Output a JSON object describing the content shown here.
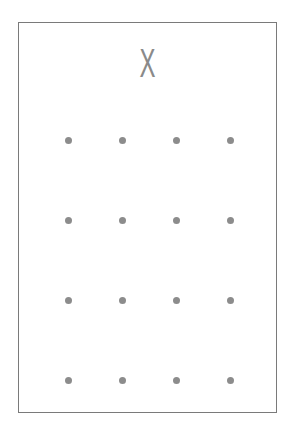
{
  "card": {
    "symbol": "X",
    "symbol_color": "#8a8a8a",
    "border_color": "#7a7a7a",
    "dot_color": "#8c8c8c",
    "grid": {
      "rows": 4,
      "cols": 4,
      "dots": [
        {
          "row": 1,
          "col": 1
        },
        {
          "row": 1,
          "col": 2
        },
        {
          "row": 1,
          "col": 3
        },
        {
          "row": 1,
          "col": 4
        },
        {
          "row": 2,
          "col": 1
        },
        {
          "row": 2,
          "col": 2
        },
        {
          "row": 2,
          "col": 3
        },
        {
          "row": 2,
          "col": 4
        },
        {
          "row": 3,
          "col": 1
        },
        {
          "row": 3,
          "col": 2
        },
        {
          "row": 3,
          "col": 3
        },
        {
          "row": 3,
          "col": 4
        },
        {
          "row": 4,
          "col": 1
        },
        {
          "row": 4,
          "col": 2
        },
        {
          "row": 4,
          "col": 3
        },
        {
          "row": 4,
          "col": 4
        }
      ]
    }
  }
}
